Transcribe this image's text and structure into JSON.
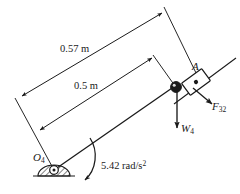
{
  "figure": {
    "background_color": "#ffffff",
    "line_color": "#1a1a1a",
    "width": 240,
    "height": 194
  },
  "dimensions": [
    {
      "id": "dim-outer",
      "label": "0.57 m",
      "value": 0.57,
      "unit": "m",
      "description": "overall length from O4 to top extension line"
    },
    {
      "id": "dim-inner",
      "label": "0.5 m",
      "value": 0.5,
      "unit": "m",
      "description": "length from O4 to joint A"
    }
  ],
  "labels": {
    "point_a": "A",
    "ground_pivot": "O",
    "ground_pivot_sub": "4",
    "force_symbol": "F",
    "force_sub": "32",
    "weight_symbol": "W",
    "weight_sub": "4",
    "alpha_value": "5.42 rad/s",
    "alpha_exponent": "2"
  },
  "kinematics": {
    "angular_acceleration": 5.42,
    "angular_acceleration_unit": "rad/s^2",
    "angular_acceleration_sense": "clockwise"
  },
  "vectors": [
    {
      "name": "F32",
      "symbol": "F",
      "subscript": "32",
      "direction": "down-right",
      "applied_at": "slider block A"
    },
    {
      "name": "W4",
      "symbol": "W",
      "subscript": "4",
      "direction": "down",
      "applied_at": "pin joint A"
    }
  ],
  "components": {
    "link_label": "link 4",
    "slider_label": "slider block",
    "pivot_label": "ground pivot",
    "rail_label": "slider rail"
  }
}
